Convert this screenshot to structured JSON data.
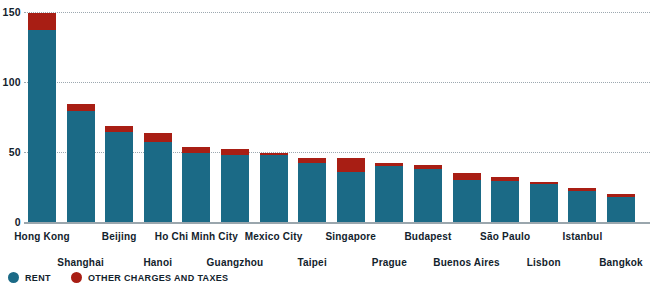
{
  "chart_data": {
    "type": "bar",
    "stacked": true,
    "title": "",
    "subtitle": "",
    "xlabel": "",
    "ylabel": "",
    "ylim": [
      0,
      150
    ],
    "yticks": [
      0,
      50,
      100,
      150
    ],
    "ytick_labels": [
      "0",
      "50",
      "100",
      "150"
    ],
    "grid": true,
    "grid_style": "dotted horizontal",
    "legend_position": "bottom-left",
    "categories": [
      "Hong Kong",
      "Shanghai",
      "Beijing",
      "Hanoi",
      "Ho Chi Minh City",
      "Guangzhou",
      "Mexico City",
      "Taipei",
      "Singapore",
      "Prague",
      "Budapest",
      "Buenos Aires",
      "São Paulo",
      "Lisbon",
      "Istanbul",
      "Bangkok"
    ],
    "series": [
      {
        "name": "RENT",
        "color": "#1b6a86",
        "values": [
          137,
          79,
          64,
          57,
          49,
          48,
          48,
          42,
          36,
          40,
          38,
          30,
          29,
          27,
          22,
          18
        ]
      },
      {
        "name": "OTHER CHARGES AND TAXES",
        "color": "#a81e14",
        "values": [
          12,
          5,
          4.5,
          6.5,
          4.5,
          4,
          1.5,
          4,
          10,
          2,
          3,
          5,
          3,
          1.5,
          2,
          2
        ]
      }
    ],
    "totals": [
      149,
      84,
      68.5,
      63.5,
      53.5,
      52,
      49.5,
      46,
      46,
      42,
      41,
      35,
      32,
      28.5,
      24,
      20
    ]
  },
  "legend": {
    "items": [
      {
        "label": "RENT",
        "color": "#1b6a86"
      },
      {
        "label": "OTHER CHARGES AND TAXES",
        "color": "#a81e14"
      }
    ]
  }
}
